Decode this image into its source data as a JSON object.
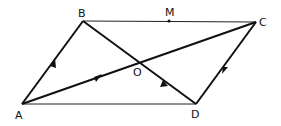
{
  "figure": {
    "type": "parallelogram-vector-diagram",
    "points": {
      "A": "A",
      "B": "B",
      "C": "C",
      "D": "D",
      "O": "O",
      "M": "M"
    },
    "segments": [
      {
        "from": "A",
        "to": "B",
        "style": "vector",
        "arrow": "toward B"
      },
      {
        "from": "A",
        "to": "C",
        "style": "vector",
        "arrow": "toward C (on AO)"
      },
      {
        "from": "B",
        "to": "D",
        "style": "vector",
        "arrow": "toward B (on DO)"
      },
      {
        "from": "C",
        "to": "D",
        "style": "vector",
        "arrow": "toward D"
      },
      {
        "from": "B",
        "to": "C",
        "style": "thin",
        "note": "M marked on BC"
      },
      {
        "from": "A",
        "to": "D",
        "style": "thin"
      }
    ],
    "labels": {
      "A": "A",
      "B": "B",
      "C": "C",
      "D": "D",
      "O": "O",
      "M": "M"
    }
  }
}
